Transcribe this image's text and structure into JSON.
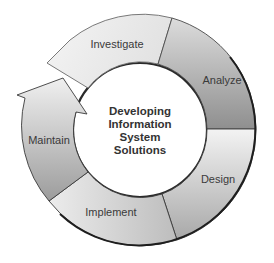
{
  "diagram": {
    "type": "cycle",
    "center_title_lines": [
      "Developing",
      "Information",
      "System",
      "Solutions"
    ],
    "stages": [
      {
        "label": "Investigate"
      },
      {
        "label": "Analyze"
      },
      {
        "label": "Design"
      },
      {
        "label": "Implement"
      },
      {
        "label": "Maintain"
      }
    ],
    "colors": {
      "outline": "#2a2a2a",
      "light_fill": "#f2f2f2",
      "mid_fill": "#c9c9c9",
      "dark_fill": "#9a9a9a",
      "text": "#3a3a3a"
    }
  }
}
